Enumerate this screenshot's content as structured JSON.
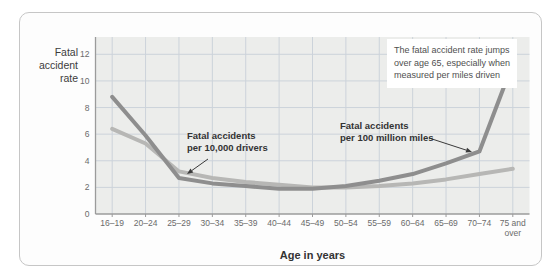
{
  "card": {
    "border_color": "#c6c6c6",
    "background": "#fdfdfd"
  },
  "chart": {
    "y_axis_title": "Fatal\naccident\nrate",
    "x_axis_title": "Age in years",
    "plot_background": "#ecedeb",
    "grid_color": "#ccd3da",
    "axis_color": "#9b9b9b",
    "tick_label_color": "#6b6b6b"
  },
  "annotations": {
    "drivers_label": "Fatal accidents\nper 10,000 drivers",
    "miles_label": "Fatal accidents\nper 100 million miles",
    "note_box": "The fatal accident rate jumps over age 65, especially when measured per miles driven",
    "arrow_color": "#3a3a3a"
  },
  "chart_data": {
    "type": "line",
    "title": "",
    "xlabel": "Age in years",
    "ylabel": "Fatal accident rate",
    "categories": [
      "16–19",
      "20–24",
      "25–29",
      "30–34",
      "35–39",
      "40–44",
      "45–49",
      "50–54",
      "55–59",
      "60–64",
      "65–69",
      "70–74",
      "75 and over"
    ],
    "y_ticks": [
      0,
      2,
      4,
      6,
      8,
      10,
      12
    ],
    "ylim": [
      0,
      13.3
    ],
    "grid": true,
    "legend_position": "inline-callouts",
    "series": [
      {
        "name": "Fatal accidents per 10,000 drivers",
        "color": "#b7b7b5",
        "values": [
          6.4,
          5.3,
          3.2,
          2.7,
          2.4,
          2.2,
          2.0,
          2.0,
          2.1,
          2.3,
          2.6,
          3.0,
          3.4
        ]
      },
      {
        "name": "Fatal accidents per 100 million miles",
        "color": "#8e8e8e",
        "values": [
          8.8,
          5.9,
          2.7,
          2.3,
          2.1,
          1.9,
          1.9,
          2.1,
          2.5,
          3.0,
          3.8,
          4.7,
          11.3
        ]
      }
    ]
  }
}
